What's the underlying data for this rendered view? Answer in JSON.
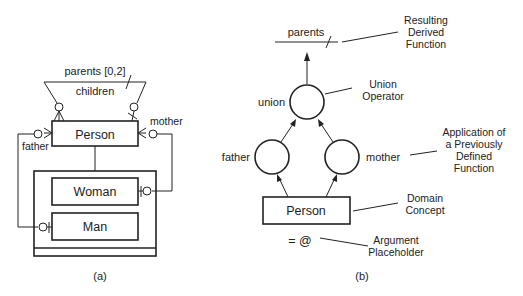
{
  "diagram_a": {
    "caption": "(a)",
    "relationship_label_top": "parents [0,2]",
    "relationship_label_bottom": "children",
    "entity_person": "Person",
    "entity_woman": "Woman",
    "entity_man": "Man",
    "role_father": "father",
    "role_mother": "mother"
  },
  "diagram_b": {
    "caption": "(b)",
    "derived_function": "parents",
    "operator": "union",
    "function_left": "father",
    "function_right": "mother",
    "domain_concept": "Person",
    "argument": "= @",
    "annotations": {
      "resulting_derived_function": [
        "Resulting",
        "Derived",
        "Function"
      ],
      "union_operator": [
        "Union",
        "Operator"
      ],
      "previously_defined_function": [
        "Application of",
        "a Previously",
        "Defined",
        "Function"
      ],
      "domain_concept": [
        "Domain",
        "Concept"
      ],
      "argument_placeholder": [
        "Argument",
        "Placeholder"
      ]
    }
  }
}
